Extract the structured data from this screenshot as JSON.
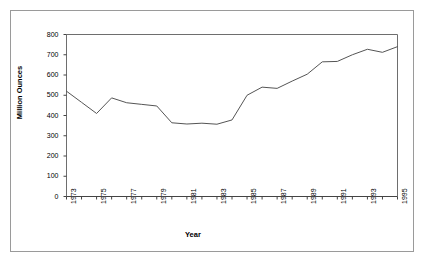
{
  "chart_data": {
    "type": "line",
    "title": "",
    "xlabel": "Year",
    "ylabel": "Million Ounces",
    "xlim": [
      1973,
      1995
    ],
    "ylim": [
      0,
      800
    ],
    "yticks": [
      0,
      100,
      200,
      300,
      400,
      500,
      600,
      700,
      800
    ],
    "ytick_labels": [
      "0",
      "100",
      "200",
      "300",
      "400",
      "500",
      "600",
      "700",
      "800"
    ],
    "xticks": [
      1973,
      1974,
      1975,
      1976,
      1977,
      1978,
      1979,
      1980,
      1981,
      1982,
      1983,
      1984,
      1985,
      1986,
      1987,
      1988,
      1989,
      1990,
      1991,
      1992,
      1993,
      1994,
      1995
    ],
    "xtick_labels": [
      "1973",
      "",
      "1975",
      "",
      "1977",
      "",
      "1979",
      "",
      "1981",
      "",
      "1983",
      "",
      "1985",
      "",
      "1987",
      "",
      "1989",
      "",
      "1991",
      "",
      "1993",
      "",
      "1995"
    ],
    "grid": false,
    "legend": false,
    "line_color": "#555555",
    "frame_color": "#6e6e6e",
    "series": [
      {
        "name": "Million Ounces",
        "x": [
          1973,
          1974,
          1975,
          1976,
          1977,
          1978,
          1979,
          1980,
          1981,
          1982,
          1983,
          1984,
          1985,
          1986,
          1987,
          1988,
          1989,
          1990,
          1991,
          1992,
          1993,
          1994,
          1995
        ],
        "values": [
          520,
          465,
          410,
          487,
          463,
          455,
          447,
          364,
          358,
          362,
          357,
          378,
          500,
          540,
          534,
          570,
          604,
          665,
          667,
          700,
          727,
          712,
          740
        ]
      }
    ]
  },
  "axes": {
    "y_axis_title": "Million Ounces",
    "x_axis_title": "Year"
  }
}
